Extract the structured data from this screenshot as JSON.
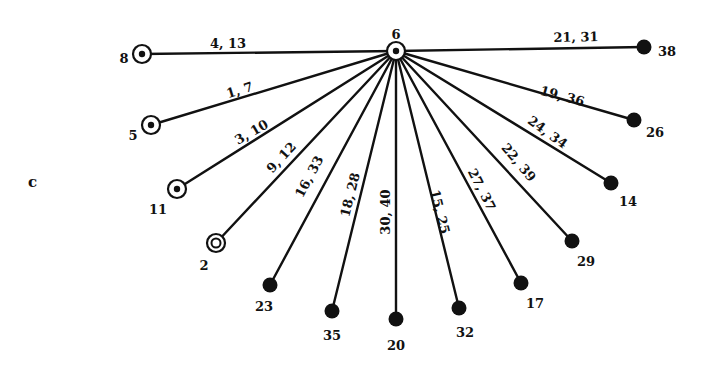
{
  "panel_label": "c",
  "colors": {
    "ink": "#111111",
    "background": "#ffffff"
  },
  "legend_styles": {
    "ringed": "concentric circle with central dot",
    "double_ring": "double concentric circle",
    "filled": "solid black circle"
  },
  "hub": {
    "id": "6",
    "style": "ringed",
    "x": 396,
    "y": 51,
    "label_dx": 0,
    "label_dy": -16
  },
  "spokes": [
    {
      "node": "8",
      "style": "ringed",
      "x": 142,
      "y": 54,
      "edge_label": "4, 13",
      "label_pos": [
        228,
        44
      ],
      "label_angle": 0,
      "node_label_pos": [
        124,
        59
      ]
    },
    {
      "node": "5",
      "style": "ringed",
      "x": 151,
      "y": 125,
      "edge_label": "1, 7",
      "label_pos": [
        240,
        91
      ],
      "label_angle": -17,
      "node_label_pos": [
        133,
        136
      ]
    },
    {
      "node": "11",
      "style": "ringed",
      "x": 177,
      "y": 189,
      "edge_label": "3, 10",
      "label_pos": [
        252,
        133
      ],
      "label_angle": -30,
      "node_label_pos": [
        158,
        210
      ]
    },
    {
      "node": "2",
      "style": "double_ring",
      "x": 216,
      "y": 243,
      "edge_label": "9, 12",
      "label_pos": [
        282,
        158
      ],
      "label_angle": -47,
      "node_label_pos": [
        204,
        266
      ]
    },
    {
      "node": "23",
      "style": "filled",
      "x": 270,
      "y": 285,
      "edge_label": "16, 33",
      "label_pos": [
        310,
        177
      ],
      "label_angle": -62,
      "node_label_pos": [
        264,
        307
      ]
    },
    {
      "node": "35",
      "style": "filled",
      "x": 332,
      "y": 311,
      "edge_label": "18, 28",
      "label_pos": [
        351,
        195
      ],
      "label_angle": -76,
      "node_label_pos": [
        332,
        336
      ]
    },
    {
      "node": "20",
      "style": "filled",
      "x": 396,
      "y": 319,
      "edge_label": "30, 40",
      "label_pos": [
        386,
        212
      ],
      "label_angle": -90,
      "node_label_pos": [
        396,
        346
      ]
    },
    {
      "node": "32",
      "style": "filled",
      "x": 459,
      "y": 308,
      "edge_label": "15, 25",
      "label_pos": [
        439,
        212
      ],
      "label_angle": 76,
      "node_label_pos": [
        465,
        333
      ]
    },
    {
      "node": "17",
      "style": "filled",
      "x": 521,
      "y": 283,
      "edge_label": "27, 37",
      "label_pos": [
        481,
        190
      ],
      "label_angle": 63,
      "node_label_pos": [
        535,
        304
      ]
    },
    {
      "node": "29",
      "style": "filled",
      "x": 572,
      "y": 241,
      "edge_label": "22, 39",
      "label_pos": [
        518,
        163
      ],
      "label_angle": 50,
      "node_label_pos": [
        586,
        262
      ]
    },
    {
      "node": "14",
      "style": "filled",
      "x": 611,
      "y": 183,
      "edge_label": "24, 34",
      "label_pos": [
        547,
        133
      ],
      "label_angle": 36,
      "node_label_pos": [
        628,
        202
      ]
    },
    {
      "node": "26",
      "style": "filled",
      "x": 634,
      "y": 120,
      "edge_label": "19, 36",
      "label_pos": [
        562,
        97
      ],
      "label_angle": 15,
      "node_label_pos": [
        655,
        133
      ]
    },
    {
      "node": "38",
      "style": "filled",
      "x": 644,
      "y": 47,
      "edge_label": "21, 31",
      "label_pos": [
        576,
        38
      ],
      "label_angle": -1,
      "node_label_pos": [
        667,
        52
      ]
    }
  ]
}
